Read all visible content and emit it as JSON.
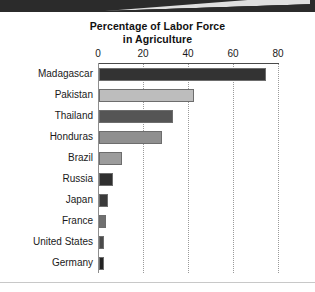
{
  "chart_data": {
    "type": "bar",
    "orientation": "horizontal",
    "title": "Percentage of Labor Force in Agriculture",
    "title_lines": [
      "Percentage of Labor Force",
      "in Agriculture"
    ],
    "xlabel": "",
    "ylabel": "",
    "xlim": [
      0,
      80
    ],
    "xticks": [
      0,
      20,
      40,
      60,
      80
    ],
    "xtick_labels": [
      "0",
      "20",
      "40",
      "60",
      "80"
    ],
    "grid": "vertical-dotted",
    "legend": "none",
    "axis_position": "top",
    "categories": [
      "Madagascar",
      "Pakistan",
      "Thailand",
      "Honduras",
      "Brazil",
      "Russia",
      "Japan",
      "France",
      "United States",
      "Germany"
    ],
    "values": [
      74,
      42,
      33,
      28,
      10,
      6,
      4,
      3,
      2,
      2
    ],
    "bar_colors": [
      "#333333",
      "#bdbdbd",
      "#555555",
      "#8f8f8f",
      "#9c9c9c",
      "#2f2f2f",
      "#3a3a3a",
      "#707070",
      "#4a4a4a",
      "#232323"
    ],
    "bars": [
      {
        "category": "Madagascar",
        "value": 74,
        "color": "#333333"
      },
      {
        "category": "Pakistan",
        "value": 42,
        "color": "#bdbdbd"
      },
      {
        "category": "Thailand",
        "value": 33,
        "color": "#555555"
      },
      {
        "category": "Honduras",
        "value": 28,
        "color": "#8f8f8f"
      },
      {
        "category": "Brazil",
        "value": 10,
        "color": "#9c9c9c"
      },
      {
        "category": "Russia",
        "value": 6,
        "color": "#2f2f2f"
      },
      {
        "category": "Japan",
        "value": 4,
        "color": "#3a3a3a"
      },
      {
        "category": "France",
        "value": 3,
        "color": "#707070"
      },
      {
        "category": "United States",
        "value": 2,
        "color": "#4a4a4a"
      },
      {
        "category": "Germany",
        "value": 2,
        "color": "#232323"
      }
    ]
  },
  "style": {
    "banner_color": "#2b2b2b",
    "page_background": "#ffffff",
    "axis_color": "#4a4a4a",
    "grid_color": "#9a9a9a",
    "text_color": "#1a1a1a"
  }
}
